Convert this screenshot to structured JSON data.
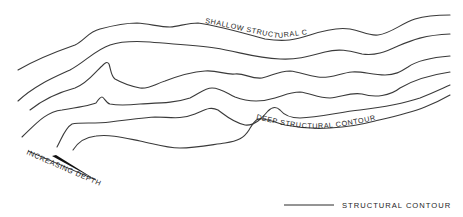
{
  "diagram": {
    "labels": {
      "shallow": "SHALLOW STRUCTURAL CONTOUR",
      "deep": "DEEP STRUCTURAL CONTOUR",
      "increasing_depth": "INCREASING DEPTH"
    },
    "legend": {
      "items": [
        {
          "symbol": "solid-line",
          "label": "STRUCTURAL CONTOUR"
        }
      ]
    },
    "contours": [
      {
        "id": "contour-1",
        "role": "shallow"
      },
      {
        "id": "contour-2",
        "role": "intermediate"
      },
      {
        "id": "contour-3",
        "role": "intermediate"
      },
      {
        "id": "contour-4",
        "role": "intermediate"
      },
      {
        "id": "contour-5",
        "role": "intermediate"
      },
      {
        "id": "contour-6",
        "role": "deep"
      }
    ],
    "colors": {
      "line": "#3a3a3a",
      "text": "#1e1e1e",
      "background": "#ffffff"
    }
  }
}
